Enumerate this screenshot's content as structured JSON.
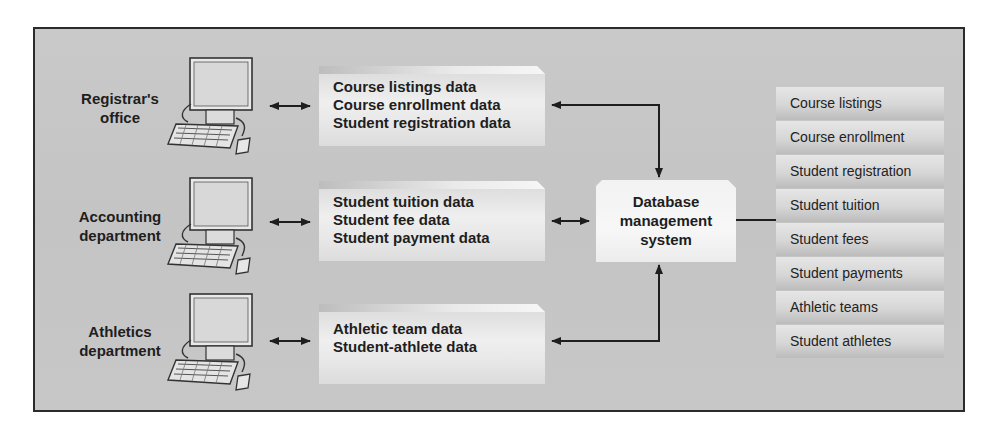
{
  "diagram": {
    "departments": [
      {
        "label_line1": "Registrar's",
        "label_line2": "office",
        "data": [
          "Course listings data",
          "Course enrollment data",
          "Student registration data"
        ]
      },
      {
        "label_line1": "Accounting",
        "label_line2": "department",
        "data": [
          "Student tuition data",
          "Student fee data",
          "Student payment data"
        ]
      },
      {
        "label_line1": "Athletics",
        "label_line2": "department",
        "data": [
          "Athletic team data",
          "Student-athlete data"
        ]
      }
    ],
    "dbms": {
      "line1": "Database",
      "line2": "management",
      "line3": "system"
    },
    "tables": [
      "Course listings",
      "Course enrollment",
      "Student registration",
      "Student tuition",
      "Student fees",
      "Student payments",
      "Athletic teams",
      "Student athletes"
    ],
    "icons": {
      "workstation": "desktop-computer-icon",
      "arrow": "bidirectional-arrow-icon"
    },
    "colors": {
      "panel": "#c7c7c7",
      "border": "#2b2b2b",
      "box_light": "#efefef",
      "text": "#1e1e1e"
    }
  }
}
